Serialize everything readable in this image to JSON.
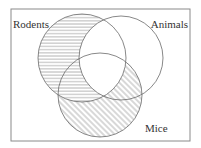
{
  "diagram": {
    "type": "venn",
    "frame": {
      "x": 11,
      "y": 9,
      "width": 179,
      "height": 132,
      "stroke": "#8a8a8a"
    },
    "line_color": "#6a6a6a",
    "hatch_color": "#7a7a7a",
    "sets": [
      {
        "id": "rodents",
        "label": "Rodents",
        "cx": 82,
        "cy": 58,
        "r": 44,
        "label_x": 13,
        "label_y": 28,
        "label_anchor": "start"
      },
      {
        "id": "animals",
        "label": "Animals",
        "cx": 121,
        "cy": 58,
        "r": 42,
        "label_x": 188,
        "label_y": 28,
        "label_anchor": "end"
      },
      {
        "id": "mice",
        "label": "Mice",
        "cx": 100,
        "cy": 95,
        "r": 42,
        "label_x": 145,
        "label_y": 132,
        "label_anchor": "start"
      }
    ],
    "shading": [
      {
        "region": "Rodents only",
        "pattern": "horizontal"
      },
      {
        "region": "Rodents ∩ Mice, not Animals",
        "pattern": "horizontal"
      },
      {
        "region": "Mice only",
        "pattern": "diagonal"
      },
      {
        "region": "Mice ∩ Animals, not Rodents",
        "pattern": "diagonal"
      },
      {
        "region": "Rodents ∩ Animals",
        "pattern": "none"
      },
      {
        "region": "Animals only",
        "pattern": "none"
      }
    ]
  }
}
